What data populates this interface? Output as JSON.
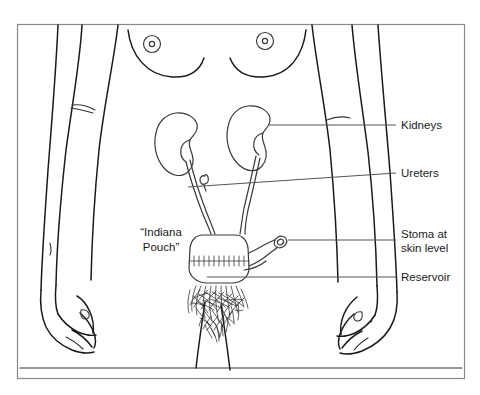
{
  "figure": {
    "background_color": "#ffffff",
    "frame_color": "#8a8a8a",
    "line_color": "#1a1a1a",
    "organ_line_color": "#3a3a3a",
    "leader_color": "#555555"
  },
  "labels": {
    "kidneys": "Kidneys",
    "ureters": "Ureters",
    "stoma_line1": "Stoma at",
    "stoma_line2": "skin level",
    "reservoir": "Reservoir",
    "pouch_line1": "“Indiana",
    "pouch_line2": "Pouch”"
  },
  "anatomy": {
    "body_part": "female torso, lower trunk with arms and upper legs",
    "organs": [
      "left kidney",
      "right kidney",
      "left ureter",
      "right ureter",
      "continent urinary reservoir pouch",
      "stoma tube"
    ]
  }
}
